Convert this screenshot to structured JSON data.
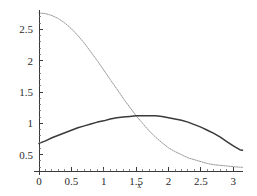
{
  "chart_data": {
    "type": "line",
    "title": "",
    "subtitle": "",
    "xlabel": "x",
    "ylabel": "",
    "xlim": [
      0,
      3.15
    ],
    "ylim": [
      0.24,
      2.84
    ],
    "grid": false,
    "legend": "none",
    "xticks": [
      0,
      0.5,
      1,
      1.5,
      2,
      2.5,
      3
    ],
    "xticklabels": [
      "0",
      "0.5",
      "1",
      "1.5",
      "2",
      "2.5",
      "3"
    ],
    "yticks": [
      0.5,
      1,
      1.5,
      2,
      2.5
    ],
    "yticklabels": [
      "0.5",
      "1",
      "1.5",
      "2",
      "2.5"
    ],
    "series": [
      {
        "name": "decaying-curve",
        "style": "dotted",
        "color": "#8c8c8c",
        "width": 0.9,
        "x": [
          0.0,
          0.1,
          0.2,
          0.3,
          0.4,
          0.5,
          0.6,
          0.7,
          0.8,
          0.9,
          1.0,
          1.1,
          1.2,
          1.3,
          1.4,
          1.5,
          1.6,
          1.7,
          1.8,
          1.9,
          2.0,
          2.1,
          2.2,
          2.3,
          2.4,
          2.5,
          2.6,
          2.7,
          2.8,
          2.9,
          3.0,
          3.1,
          3.1416
        ],
        "y": [
          2.76,
          2.75,
          2.72,
          2.67,
          2.6,
          2.51,
          2.4,
          2.28,
          2.14,
          2.0,
          1.85,
          1.7,
          1.55,
          1.4,
          1.26,
          1.12,
          1.0,
          0.88,
          0.78,
          0.69,
          0.61,
          0.55,
          0.5,
          0.45,
          0.42,
          0.39,
          0.36,
          0.34,
          0.33,
          0.32,
          0.31,
          0.3,
          0.3
        ]
      },
      {
        "name": "humped-curve",
        "style": "solid",
        "color": "#3a3a3a",
        "width": 1.5,
        "x": [
          0.0,
          0.1,
          0.2,
          0.3,
          0.4,
          0.5,
          0.6,
          0.7,
          0.8,
          0.9,
          1.0,
          1.1,
          1.2,
          1.3,
          1.4,
          1.5,
          1.6,
          1.7,
          1.8,
          1.9,
          2.0,
          2.1,
          2.2,
          2.3,
          2.4,
          2.5,
          2.6,
          2.7,
          2.8,
          2.9,
          3.0,
          3.1,
          3.1416
        ],
        "y": [
          0.68,
          0.72,
          0.77,
          0.81,
          0.85,
          0.89,
          0.93,
          0.96,
          0.99,
          1.02,
          1.04,
          1.07,
          1.09,
          1.1,
          1.11,
          1.12,
          1.12,
          1.12,
          1.12,
          1.11,
          1.09,
          1.07,
          1.05,
          1.02,
          0.98,
          0.94,
          0.89,
          0.84,
          0.78,
          0.71,
          0.64,
          0.58,
          0.57
        ]
      }
    ]
  },
  "axes": {
    "x_axis_label": "x",
    "x_tick_0": "0",
    "x_tick_1": "0.5",
    "x_tick_2": "1",
    "x_tick_3": "1.5",
    "x_tick_4": "2",
    "x_tick_5": "2.5",
    "x_tick_6": "3",
    "y_tick_0": "0.5",
    "y_tick_1": "1",
    "y_tick_2": "1.5",
    "y_tick_3": "2",
    "y_tick_4": "2.5"
  },
  "colors": {
    "axis": "#3a3a3a",
    "series_dotted": "#8c8c8c",
    "series_solid": "#3a3a3a",
    "background": "#ffffff"
  }
}
